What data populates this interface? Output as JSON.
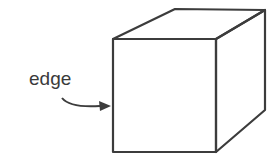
{
  "diagram": {
    "label": "edge",
    "stroke_color": "#3c3c3c",
    "background": "#ffffff"
  }
}
